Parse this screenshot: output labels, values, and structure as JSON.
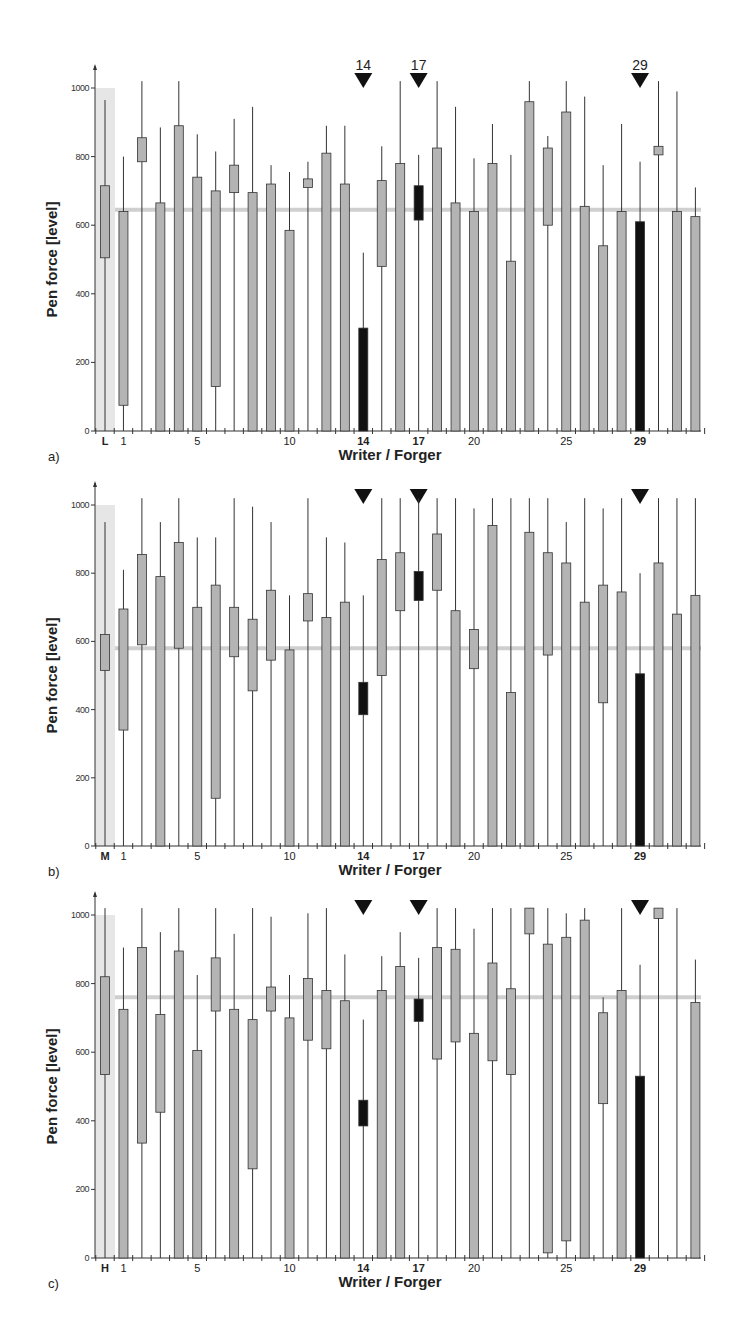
{
  "figure": {
    "colors": {
      "box_fill": "#b4b4b4",
      "highlight_fill": "#111111",
      "stroke": "#333333",
      "mean_line": "#cfcfcf",
      "ref_band": "#e6e6e6",
      "axis": "#333333"
    }
  },
  "chart_data": [
    {
      "type": "box",
      "panel_label": "a)",
      "title": "",
      "xlabel": "Writer / Forger",
      "ylabel": "Pen force [level]",
      "ylim": [
        0,
        1000
      ],
      "yticks": [
        0,
        200,
        400,
        600,
        800,
        1000
      ],
      "xtick_labels": [
        {
          "index": 0,
          "label": "L",
          "bold": true
        },
        {
          "index": 1,
          "label": "1"
        },
        {
          "index": 5,
          "label": "5"
        },
        {
          "index": 10,
          "label": "10"
        },
        {
          "index": 14,
          "label": "14",
          "bold": true
        },
        {
          "index": 17,
          "label": "17",
          "bold": true
        },
        {
          "index": 20,
          "label": "20"
        },
        {
          "index": 25,
          "label": "25"
        },
        {
          "index": 29,
          "label": "29",
          "bold": true
        }
      ],
      "markers": [
        {
          "index": 14,
          "label": "14"
        },
        {
          "index": 17,
          "label": "17"
        },
        {
          "index": 29,
          "label": "29"
        }
      ],
      "reference_column": "L",
      "mean_line": 645,
      "highlighted": [
        14,
        17,
        29
      ],
      "categories": [
        "L",
        "1",
        "2",
        "3",
        "4",
        "5",
        "6",
        "7",
        "8",
        "9",
        "10",
        "11",
        "12",
        "13",
        "14",
        "15",
        "16",
        "17",
        "18",
        "19",
        "20",
        "21",
        "22",
        "23",
        "24",
        "25",
        "26",
        "27",
        "28",
        "29",
        "30",
        "31",
        "32"
      ],
      "boxes": [
        [
          965,
          715,
          505,
          0
        ],
        [
          800,
          640,
          75,
          0
        ],
        [
          1020,
          855,
          785,
          0
        ],
        [
          885,
          665,
          0,
          0
        ],
        [
          1020,
          890,
          0,
          0
        ],
        [
          865,
          740,
          0,
          0
        ],
        [
          815,
          700,
          130,
          0
        ],
        [
          910,
          775,
          695,
          0
        ],
        [
          945,
          695,
          0,
          0
        ],
        [
          775,
          720,
          0,
          0
        ],
        [
          755,
          585,
          0,
          0
        ],
        [
          785,
          735,
          710,
          0
        ],
        [
          890,
          810,
          0,
          0
        ],
        [
          890,
          720,
          0,
          0
        ],
        [
          520,
          300,
          0,
          0
        ],
        [
          830,
          730,
          480,
          0
        ],
        [
          1020,
          780,
          0,
          0
        ],
        [
          805,
          715,
          615,
          0
        ],
        [
          1020,
          825,
          0,
          0
        ],
        [
          945,
          665,
          0,
          0
        ],
        [
          795,
          640,
          0,
          0
        ],
        [
          895,
          780,
          0,
          0
        ],
        [
          805,
          495,
          0,
          0
        ],
        [
          1020,
          960,
          0,
          0
        ],
        [
          860,
          825,
          600,
          0
        ],
        [
          1020,
          930,
          0,
          0
        ],
        [
          975,
          655,
          0,
          0
        ],
        [
          775,
          540,
          0,
          0
        ],
        [
          895,
          640,
          0,
          0
        ],
        [
          785,
          610,
          0,
          0
        ],
        [
          1020,
          830,
          805,
          0
        ],
        [
          990,
          640,
          0,
          0
        ],
        [
          710,
          625,
          0,
          0
        ]
      ],
      "box_format": "[whisker_top, box_top, box_bottom, whisker_bottom]"
    },
    {
      "type": "box",
      "panel_label": "b)",
      "title": "",
      "xlabel": "Writer / Forger",
      "ylabel": "Pen force [level]",
      "ylim": [
        0,
        1000
      ],
      "yticks": [
        0,
        200,
        400,
        600,
        800,
        1000
      ],
      "xtick_labels": [
        {
          "index": 0,
          "label": "M",
          "bold": true
        },
        {
          "index": 1,
          "label": "1"
        },
        {
          "index": 5,
          "label": "5"
        },
        {
          "index": 10,
          "label": "10"
        },
        {
          "index": 14,
          "label": "14",
          "bold": true
        },
        {
          "index": 17,
          "label": "17",
          "bold": true
        },
        {
          "index": 20,
          "label": "20"
        },
        {
          "index": 25,
          "label": "25"
        },
        {
          "index": 29,
          "label": "29",
          "bold": true
        }
      ],
      "markers": [
        {
          "index": 14,
          "label": ""
        },
        {
          "index": 17,
          "label": ""
        },
        {
          "index": 29,
          "label": ""
        }
      ],
      "reference_column": "M",
      "mean_line": 580,
      "highlighted": [
        14,
        17,
        29
      ],
      "categories": [
        "M",
        "1",
        "2",
        "3",
        "4",
        "5",
        "6",
        "7",
        "8",
        "9",
        "10",
        "11",
        "12",
        "13",
        "14",
        "15",
        "16",
        "17",
        "18",
        "19",
        "20",
        "21",
        "22",
        "23",
        "24",
        "25",
        "26",
        "27",
        "28",
        "29",
        "30",
        "31",
        "32"
      ],
      "boxes": [
        [
          950,
          620,
          515,
          0
        ],
        [
          810,
          695,
          340,
          0
        ],
        [
          1020,
          855,
          590,
          0
        ],
        [
          950,
          790,
          0,
          0
        ],
        [
          1020,
          890,
          580,
          0
        ],
        [
          905,
          700,
          0,
          0
        ],
        [
          905,
          765,
          140,
          0
        ],
        [
          1020,
          700,
          555,
          0
        ],
        [
          995,
          665,
          455,
          0
        ],
        [
          950,
          750,
          545,
          0
        ],
        [
          735,
          575,
          0,
          0
        ],
        [
          1020,
          740,
          660,
          0
        ],
        [
          905,
          670,
          0,
          0
        ],
        [
          890,
          715,
          0,
          0
        ],
        [
          735,
          480,
          385,
          0
        ],
        [
          1020,
          840,
          500,
          0
        ],
        [
          1020,
          860,
          690,
          0
        ],
        [
          1020,
          805,
          720,
          0
        ],
        [
          1020,
          915,
          750,
          0
        ],
        [
          1020,
          690,
          0,
          0
        ],
        [
          990,
          635,
          520,
          0
        ],
        [
          1020,
          940,
          0,
          0
        ],
        [
          1020,
          450,
          0,
          0
        ],
        [
          1020,
          920,
          0,
          0
        ],
        [
          1020,
          860,
          560,
          0
        ],
        [
          950,
          830,
          0,
          0
        ],
        [
          1020,
          715,
          0,
          0
        ],
        [
          990,
          765,
          420,
          0
        ],
        [
          1020,
          745,
          0,
          0
        ],
        [
          800,
          505,
          0,
          0
        ],
        [
          1020,
          830,
          0,
          0
        ],
        [
          1020,
          680,
          0,
          0
        ],
        [
          1020,
          735,
          0,
          0
        ]
      ],
      "box_format": "[whisker_top, box_top, box_bottom, whisker_bottom]"
    },
    {
      "type": "box",
      "panel_label": "c)",
      "title": "",
      "xlabel": "Writer / Forger",
      "ylabel": "Pen force [level]",
      "ylim": [
        0,
        1000
      ],
      "yticks": [
        0,
        200,
        400,
        600,
        800,
        1000
      ],
      "xtick_labels": [
        {
          "index": 0,
          "label": "H",
          "bold": true
        },
        {
          "index": 1,
          "label": "1"
        },
        {
          "index": 5,
          "label": "5"
        },
        {
          "index": 10,
          "label": "10"
        },
        {
          "index": 14,
          "label": "14",
          "bold": true
        },
        {
          "index": 17,
          "label": "17",
          "bold": true
        },
        {
          "index": 20,
          "label": "20"
        },
        {
          "index": 25,
          "label": "25"
        },
        {
          "index": 29,
          "label": "29",
          "bold": true
        }
      ],
      "markers": [
        {
          "index": 14,
          "label": ""
        },
        {
          "index": 17,
          "label": ""
        },
        {
          "index": 29,
          "label": ""
        }
      ],
      "reference_column": "H",
      "mean_line": 760,
      "highlighted": [
        14,
        17,
        29
      ],
      "categories": [
        "H",
        "1",
        "2",
        "3",
        "4",
        "5",
        "6",
        "7",
        "8",
        "9",
        "10",
        "11",
        "12",
        "13",
        "14",
        "15",
        "16",
        "17",
        "18",
        "19",
        "20",
        "21",
        "22",
        "23",
        "24",
        "25",
        "26",
        "27",
        "28",
        "29",
        "30",
        "31",
        "32"
      ],
      "boxes": [
        [
          1020,
          820,
          535,
          0
        ],
        [
          905,
          725,
          0,
          0
        ],
        [
          1020,
          905,
          335,
          0
        ],
        [
          950,
          710,
          425,
          0
        ],
        [
          1020,
          895,
          0,
          0
        ],
        [
          825,
          605,
          0,
          0
        ],
        [
          1020,
          875,
          720,
          0
        ],
        [
          945,
          725,
          0,
          0
        ],
        [
          1020,
          695,
          260,
          0
        ],
        [
          995,
          790,
          720,
          0
        ],
        [
          825,
          700,
          0,
          0
        ],
        [
          1005,
          815,
          635,
          0
        ],
        [
          1020,
          780,
          610,
          0
        ],
        [
          885,
          750,
          0,
          0
        ],
        [
          695,
          460,
          385,
          0
        ],
        [
          880,
          780,
          0,
          0
        ],
        [
          950,
          850,
          0,
          0
        ],
        [
          875,
          755,
          690,
          0
        ],
        [
          1020,
          905,
          580,
          0
        ],
        [
          1020,
          900,
          630,
          0
        ],
        [
          960,
          655,
          0,
          0
        ],
        [
          1020,
          860,
          575,
          0
        ],
        [
          1020,
          785,
          535,
          0
        ],
        [
          1020,
          1020,
          945,
          0
        ],
        [
          1020,
          915,
          15,
          0
        ],
        [
          1005,
          935,
          50,
          0
        ],
        [
          1020,
          985,
          0,
          0
        ],
        [
          760,
          715,
          450,
          0
        ],
        [
          1020,
          780,
          0,
          0
        ],
        [
          855,
          530,
          0,
          0
        ],
        [
          1020,
          1020,
          990,
          0
        ],
        [
          1020,
          0,
          0,
          0
        ],
        [
          870,
          745,
          0,
          0
        ]
      ],
      "box_format": "[whisker_top, box_top, box_bottom, whisker_bottom]"
    }
  ]
}
